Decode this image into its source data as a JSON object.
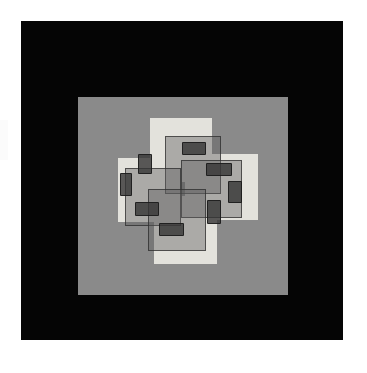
{
  "artwork": {
    "title": "Geometric Abstract Composition",
    "medium_note": "Pinwheel of overlapping squares on gray ground in black frame",
    "page_background": "#ffffff",
    "frame_color": "#050505",
    "ground_color": "#8a8a8a",
    "light_square_color": "#e3e2dc",
    "veil_square_color": "rgba(92,92,92,0.42)",
    "veil_outline_color": "rgba(42,42,42,0.72)",
    "chip_color": "rgba(52,52,52,0.80)",
    "canvas": {
      "width": 367,
      "height": 373
    },
    "frame": {
      "x": 21,
      "y": 21,
      "width": 322,
      "height": 319
    },
    "ground": {
      "x": 57,
      "y": 76,
      "width": 210,
      "height": 198
    }
  },
  "chart_data": {
    "type": "scatter",
    "xlabel": "",
    "ylabel": "",
    "xlim": [
      0,
      210
    ],
    "ylim": [
      0,
      198
    ],
    "grid": false,
    "legend": "none",
    "series": [
      {
        "name": "light-squares",
        "fill": "#e3e2dc",
        "values": [
          {
            "id": "light-square-top",
            "x": 72,
            "y": 21,
            "w": 62,
            "h": 64
          },
          {
            "id": "light-square-left",
            "x": 40,
            "y": 61,
            "w": 64,
            "h": 64
          },
          {
            "id": "light-square-right",
            "x": 107,
            "y": 57,
            "w": 73,
            "h": 66
          },
          {
            "id": "light-square-bottom",
            "x": 76,
            "y": 99,
            "w": 63,
            "h": 68
          }
        ]
      },
      {
        "name": "veil-squares",
        "fill": "rgba(92,92,92,0.42)",
        "stroke": "rgba(42,42,42,0.72)",
        "values": [
          {
            "id": "veil-square-upper",
            "x": 87,
            "y": 39,
            "w": 56,
            "h": 58
          },
          {
            "id": "veil-square-left",
            "x": 47,
            "y": 71,
            "w": 56,
            "h": 58
          },
          {
            "id": "veil-square-right",
            "x": 103,
            "y": 63,
            "w": 61,
            "h": 58
          },
          {
            "id": "veil-square-lower",
            "x": 70,
            "y": 92,
            "w": 58,
            "h": 62
          }
        ]
      },
      {
        "name": "dark-chips",
        "fill": "rgba(52,52,52,0.80)",
        "values": [
          {
            "id": "chip-top",
            "x": 104,
            "y": 45,
            "w": 24,
            "h": 13
          },
          {
            "id": "chip-upper-left",
            "x": 60,
            "y": 57,
            "w": 14,
            "h": 20
          },
          {
            "id": "chip-mid-right",
            "x": 128,
            "y": 66,
            "w": 26,
            "h": 13
          },
          {
            "id": "chip-left",
            "x": 42,
            "y": 76,
            "w": 12,
            "h": 23
          },
          {
            "id": "chip-right",
            "x": 150,
            "y": 84,
            "w": 14,
            "h": 22
          },
          {
            "id": "chip-lower-left",
            "x": 57,
            "y": 105,
            "w": 24,
            "h": 14
          },
          {
            "id": "chip-lower-right",
            "x": 129,
            "y": 103,
            "w": 14,
            "h": 24
          },
          {
            "id": "chip-bottom",
            "x": 81,
            "y": 126,
            "w": 25,
            "h": 13
          }
        ]
      }
    ]
  }
}
